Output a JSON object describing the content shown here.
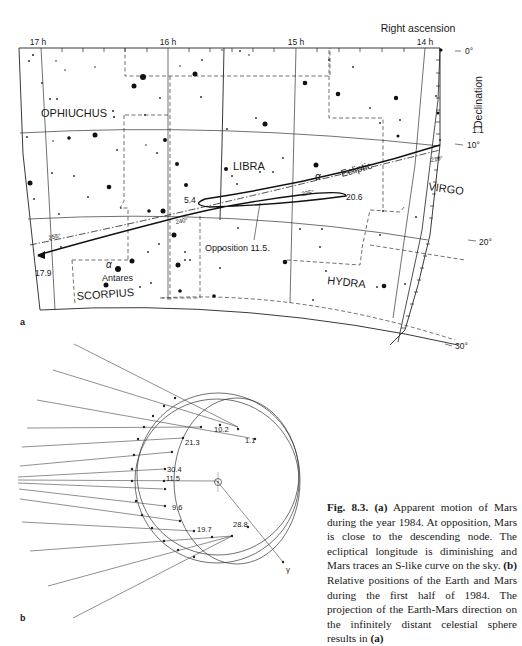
{
  "panel_a": {
    "label": "a",
    "axis_title_ra": "Right ascension",
    "axis_title_dec": "Declination",
    "ra_ticks": [
      "17 h",
      "16 h",
      "15 h",
      "14 h"
    ],
    "dec_ticks": [
      "0°",
      "10°",
      "20°",
      "30°"
    ],
    "constellations": [
      "OPHIUCHUS",
      "LIBRA",
      "VIRGO",
      "HYDRA",
      "SCORPIUS"
    ],
    "ecliptic_label": "Ecliptic",
    "ecliptic_longitudes": [
      "255°",
      "240°",
      "225°",
      "210°"
    ],
    "star_labels": {
      "alpha_lib": "α",
      "alpha_sco": "α",
      "antares": "Antares"
    },
    "date_labels": {
      "start": "1.1",
      "stationary1": "5.4",
      "stationary2": "20.6",
      "end": "17.9",
      "opposition": "Opposition 11.5."
    }
  },
  "panel_b": {
    "label": "b",
    "date_labels": [
      "10.2",
      "1.1",
      "21.3",
      "30.4",
      "11.5",
      "9.6",
      "19.7",
      "28.8"
    ],
    "aries_label": "γ",
    "sun_symbol": "☉"
  },
  "caption": {
    "fig": "Fig. 8.3.",
    "a_tag": "(a)",
    "text1": " Apparent motion of Mars during the year 1984. At opposition, Mars is close to the descending node. The ecliptical longitude is diminishing and Mars traces an S-like curve on the sky. ",
    "b_tag": "(b)",
    "text2": " Relative positions of the Earth and Mars during the first half of 1984. The projection of the Earth-Mars direction on the infinitely distant celestial sphere results in ",
    "end_tag": "(a)"
  }
}
